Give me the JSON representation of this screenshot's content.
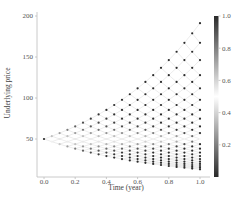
{
  "chart_data": {
    "type": "scatter",
    "subtype": "binomial-tree-lattice",
    "title": "",
    "xlabel": "Time (year)",
    "ylabel": "Underlying price",
    "xlim": [
      -0.05,
      1.05
    ],
    "ylim": [
      0,
      205
    ],
    "xticks": [
      0.0,
      0.2,
      0.4,
      0.6,
      0.8,
      1.0
    ],
    "xtick_labels": [
      "0.0",
      "0.2",
      "0.4",
      "0.6",
      "0.8",
      "1.0"
    ],
    "yticks": [
      50,
      100,
      150,
      200
    ],
    "ytick_labels": [
      "50",
      "100",
      "150",
      "200"
    ],
    "grid": false,
    "tree": {
      "S0": 50,
      "T": 1.0,
      "steps": 20,
      "sigma": 0.3,
      "up_factor": 1.0694,
      "down_factor": 0.9351,
      "max_price_at_T": 191.2,
      "min_price_at_T": 13.1,
      "edge_color": "#d9d9d9",
      "color_value": "delta-like N(d1), K=50"
    },
    "colorbar": {
      "ticks": [
        0.2,
        0.4,
        0.6,
        0.8,
        1.0
      ],
      "tick_labels": [
        "0.2",
        "0.4",
        "0.6",
        "0.8",
        "1.0"
      ],
      "range": [
        0.0,
        1.0
      ],
      "colormap": [
        "#2a2a2a",
        "#ffffff",
        "#2a2a2a"
      ],
      "position": "right"
    }
  }
}
